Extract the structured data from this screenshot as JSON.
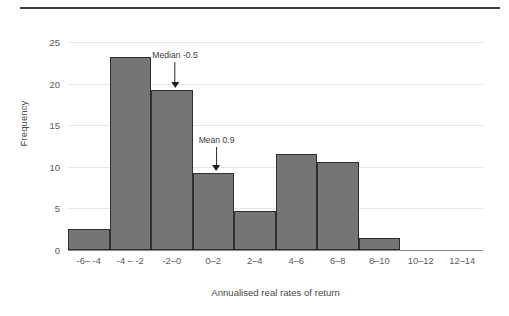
{
  "figure": {
    "top_rule_color": "#3d3d3d",
    "bar_fill_color": "#757575",
    "bar_edge_color": "#2f2f2f",
    "gridline_color": "#e6e6e6"
  },
  "chart_data": {
    "type": "bar",
    "title": "",
    "subtitle": "",
    "xlabel": "Annualised real rates of return",
    "ylabel": "Frequency",
    "categories": [
      "-6– -4",
      "-4 – -2",
      "-2–0",
      "0–2",
      "2–4",
      "4–6",
      "6–8",
      "8–10",
      "10–12",
      "12–14"
    ],
    "values": [
      2.5,
      23.2,
      19.2,
      9.3,
      4.7,
      11.5,
      10.6,
      1.4,
      0,
      0
    ],
    "series": [
      {
        "name": "Frequency",
        "values": [
          2.5,
          23.2,
          19.2,
          9.3,
          4.7,
          11.5,
          10.6,
          1.4,
          0,
          0
        ]
      }
    ],
    "ylim": [
      0,
      25
    ],
    "yticks": [
      0,
      5,
      10,
      15,
      20,
      25
    ],
    "ytick_labels": [
      "0",
      "5",
      "10",
      "15",
      "20",
      "25"
    ],
    "grid": "horizontal",
    "legend": "none",
    "bar_gap": 0,
    "annotations": [
      {
        "label": "Median -0.5",
        "value": -0.5,
        "category_index": 2,
        "arrow": "down"
      },
      {
        "label": "Mean 0.9",
        "value": 0.9,
        "category_index": 3,
        "arrow": "down"
      }
    ]
  }
}
